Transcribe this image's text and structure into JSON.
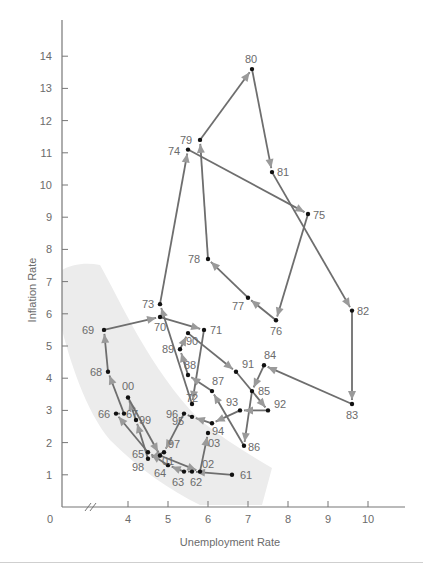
{
  "chart_data": {
    "type": "line",
    "title": "",
    "xlabel": "Unemployment Rate",
    "ylabel": "Inflation Rate",
    "xlim": [
      3,
      10.8
    ],
    "ylim": [
      0,
      15
    ],
    "x_ticks": [
      "4",
      "5",
      "6",
      "7",
      "8",
      "9",
      "10"
    ],
    "y_ticks": [
      "1",
      "2",
      "3",
      "4",
      "5",
      "6",
      "7",
      "8",
      "9",
      "10",
      "11",
      "12",
      "13",
      "14"
    ],
    "origin_label": "0",
    "axis_break": true,
    "grid": false,
    "legend": null,
    "annotation": "Shaded band showing the short-run Phillips curve trade-off (1960s and late 1990s-2000s)",
    "series": [
      {
        "name": "US inflation vs unemployment by year",
        "points": [
          {
            "year": "61",
            "x": 6.6,
            "y": 1.0
          },
          {
            "year": "62",
            "x": 5.6,
            "y": 1.1
          },
          {
            "year": "63",
            "x": 5.4,
            "y": 1.1
          },
          {
            "year": "64",
            "x": 5.0,
            "y": 1.3
          },
          {
            "year": "65",
            "x": 4.5,
            "y": 1.7
          },
          {
            "year": "66",
            "x": 3.7,
            "y": 2.9
          },
          {
            "year": "67",
            "x": 3.9,
            "y": 2.9
          },
          {
            "year": "68",
            "x": 3.5,
            "y": 4.2
          },
          {
            "year": "69",
            "x": 3.4,
            "y": 5.5
          },
          {
            "year": "70",
            "x": 4.8,
            "y": 5.9
          },
          {
            "year": "71",
            "x": 5.9,
            "y": 5.5
          },
          {
            "year": "72",
            "x": 5.6,
            "y": 3.2
          },
          {
            "year": "73",
            "x": 4.8,
            "y": 6.3
          },
          {
            "year": "74",
            "x": 5.5,
            "y": 11.1
          },
          {
            "year": "75",
            "x": 8.5,
            "y": 9.1
          },
          {
            "year": "76",
            "x": 7.7,
            "y": 5.8
          },
          {
            "year": "77",
            "x": 7.0,
            "y": 6.5
          },
          {
            "year": "78",
            "x": 6.0,
            "y": 7.7
          },
          {
            "year": "79",
            "x": 5.8,
            "y": 11.4
          },
          {
            "year": "80",
            "x": 7.1,
            "y": 13.6
          },
          {
            "year": "81",
            "x": 7.6,
            "y": 10.4
          },
          {
            "year": "82",
            "x": 9.6,
            "y": 6.1
          },
          {
            "year": "83",
            "x": 9.6,
            "y": 3.2
          },
          {
            "year": "84",
            "x": 7.4,
            "y": 4.4
          },
          {
            "year": "85",
            "x": 7.1,
            "y": 3.6
          },
          {
            "year": "86",
            "x": 6.9,
            "y": 1.9
          },
          {
            "year": "87",
            "x": 6.1,
            "y": 3.6
          },
          {
            "year": "88",
            "x": 5.5,
            "y": 4.1
          },
          {
            "year": "89",
            "x": 5.3,
            "y": 4.9
          },
          {
            "year": "90",
            "x": 5.5,
            "y": 5.4
          },
          {
            "year": "91",
            "x": 6.7,
            "y": 4.2
          },
          {
            "year": "92",
            "x": 7.5,
            "y": 3.0
          },
          {
            "year": "93",
            "x": 6.8,
            "y": 3.0
          },
          {
            "year": "94",
            "x": 6.1,
            "y": 2.6
          },
          {
            "year": "95",
            "x": 5.6,
            "y": 2.8
          },
          {
            "year": "96",
            "x": 5.4,
            "y": 2.9
          },
          {
            "year": "97",
            "x": 4.9,
            "y": 1.7
          },
          {
            "year": "98",
            "x": 4.5,
            "y": 1.5
          },
          {
            "year": "99",
            "x": 4.2,
            "y": 2.7
          },
          {
            "year": "00",
            "x": 4.0,
            "y": 3.4
          },
          {
            "year": "01",
            "x": 4.8,
            "y": 1.6
          },
          {
            "year": "02",
            "x": 5.8,
            "y": 1.1
          },
          {
            "year": "03",
            "x": 6.0,
            "y": 2.3
          }
        ]
      }
    ]
  },
  "layout": {
    "line_color": "#6e6e6e",
    "arrow_color": "#9a9a9a",
    "point_color": "#111111",
    "band_color": "#ececec"
  },
  "labels": {
    "xlabel": "Unemployment Rate",
    "ylabel": "Inflation Rate",
    "origin": "0"
  }
}
